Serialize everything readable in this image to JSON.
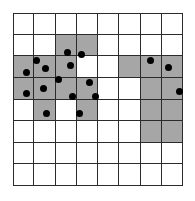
{
  "grid": {
    "rows": 8,
    "cols": 8,
    "left": 13,
    "top": 13,
    "width": 170,
    "height": 173,
    "line_color": "#2b2b2b",
    "empty_color": "#ffffff",
    "shaded_color": "#a6a6a6",
    "shaded_cells": [
      [
        1,
        2
      ],
      [
        1,
        3
      ],
      [
        2,
        0
      ],
      [
        2,
        1
      ],
      [
        2,
        2
      ],
      [
        2,
        5
      ],
      [
        2,
        6
      ],
      [
        2,
        7
      ],
      [
        3,
        0
      ],
      [
        3,
        1
      ],
      [
        3,
        2
      ],
      [
        3,
        3
      ],
      [
        3,
        6
      ],
      [
        3,
        7
      ],
      [
        4,
        1
      ],
      [
        4,
        3
      ],
      [
        4,
        6
      ],
      [
        4,
        7
      ],
      [
        5,
        6
      ],
      [
        5,
        7
      ]
    ]
  },
  "points": {
    "color": "#000000",
    "coords": [
      [
        67,
        52
      ],
      [
        81,
        54
      ],
      [
        70,
        65
      ],
      [
        36,
        60
      ],
      [
        26,
        72
      ],
      [
        45,
        68
      ],
      [
        58,
        79
      ],
      [
        26,
        93
      ],
      [
        43,
        88
      ],
      [
        89,
        82
      ],
      [
        72,
        96
      ],
      [
        95,
        96
      ],
      [
        46,
        113
      ],
      [
        79,
        113
      ],
      [
        150,
        60
      ],
      [
        168,
        67
      ],
      [
        179,
        91
      ]
    ]
  }
}
